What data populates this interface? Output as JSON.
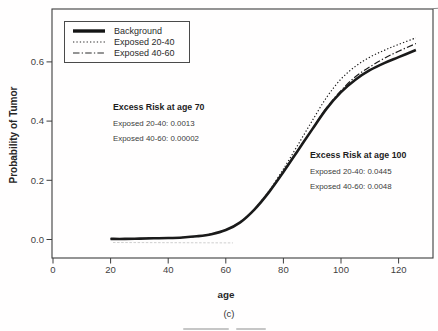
{
  "figure": {
    "caption": "(c)"
  },
  "colors": {
    "ink": "#1a1a1a",
    "frame": "#3d3d3d",
    "background": "#ffffff",
    "tick_text": "#3f3f3f"
  },
  "chart_data": {
    "type": "line",
    "title": "",
    "xlabel": "age",
    "ylabel": "Probability of Tumor",
    "x_ticks": [
      0,
      20,
      40,
      60,
      80,
      100,
      120
    ],
    "y_ticks": [
      0.0,
      0.2,
      0.4,
      0.6
    ],
    "y_tick_labels": [
      "0.0",
      "0.2",
      "0.4",
      "0.6"
    ],
    "xlim": [
      0,
      132
    ],
    "ylim": [
      -0.065,
      0.78
    ],
    "grid": false,
    "legend_position": "top-left",
    "x": [
      20,
      25,
      30,
      35,
      40,
      45,
      50,
      55,
      60,
      65,
      70,
      75,
      80,
      85,
      90,
      95,
      100,
      105,
      110,
      115,
      120,
      126
    ],
    "series": [
      {
        "name": "Background",
        "style": "solid-thick",
        "values": [
          0.002,
          0.002,
          0.003,
          0.004,
          0.005,
          0.007,
          0.011,
          0.018,
          0.032,
          0.058,
          0.102,
          0.16,
          0.228,
          0.3,
          0.372,
          0.442,
          0.498,
          0.54,
          0.572,
          0.596,
          0.616,
          0.64
        ]
      },
      {
        "name": "Exposed 20-40",
        "style": "dotted",
        "values": [
          0.002,
          0.002,
          0.003,
          0.004,
          0.005,
          0.007,
          0.011,
          0.018,
          0.032,
          0.059,
          0.103,
          0.164,
          0.238,
          0.319,
          0.401,
          0.48,
          0.542,
          0.585,
          0.616,
          0.639,
          0.659,
          0.681
        ]
      },
      {
        "name": "Exposed 40-60",
        "style": "dash-dot",
        "values": [
          0.002,
          0.002,
          0.003,
          0.004,
          0.005,
          0.007,
          0.011,
          0.018,
          0.032,
          0.058,
          0.102,
          0.16,
          0.228,
          0.301,
          0.373,
          0.445,
          0.503,
          0.55,
          0.583,
          0.612,
          0.636,
          0.662
        ]
      }
    ],
    "annotations": [
      {
        "title": "Excess Risk at age 70",
        "lines": [
          "Exposed 20-40: 0.0013",
          "Exposed 40-60: 0.00002"
        ]
      },
      {
        "title": "Excess Risk at age 100",
        "lines": [
          "Exposed 20-40: 0.0445",
          "Exposed 40-60: 0.0048"
        ]
      }
    ]
  }
}
